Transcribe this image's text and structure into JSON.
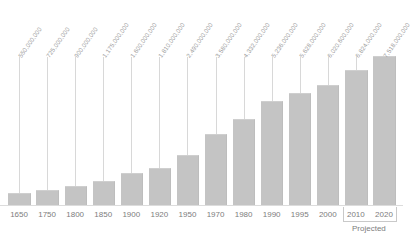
{
  "chart_data": {
    "type": "bar",
    "title": "",
    "subtitle": "",
    "xlabel": "",
    "ylabel": "",
    "grid": false,
    "legend": null,
    "ylim": [
      0,
      7518000000
    ],
    "categories": [
      "1650",
      "1750",
      "1800",
      "1850",
      "1900",
      "1920",
      "1950",
      "1970",
      "1980",
      "1990",
      "1995",
      "2000",
      "2010",
      "2020"
    ],
    "values": [
      550000000,
      725000000,
      900000000,
      1175000000,
      1600000000,
      1810000000,
      2490000000,
      3580000000,
      4332000000,
      5236000000,
      5628000000,
      6020600000,
      6824000000,
      7518000000
    ],
    "value_labels": [
      "550,000,000",
      "725,000,000",
      "900,000,000",
      "1,175,000,000",
      "1,600,000,000",
      "1,810,000,000",
      "2,490,000,000",
      "3,580,000,000",
      "4,332,000,000",
      "5,236,000,000",
      "5,628,000,000",
      "6,020,600,000",
      "6,824,000,000",
      "7,518,000,000"
    ],
    "annotations": [
      {
        "text": "Projected",
        "applies_to": [
          "2010",
          "2020"
        ]
      }
    ],
    "colors": {
      "bar": "#c4c4c4",
      "bar_edge": "#bdbdbd",
      "leader_line": "#d8d8d8",
      "axis": "#dcdcdc",
      "value_label_text": "#9b9b9b",
      "year_label_text": "#7d7d7d",
      "background": "#ffffff"
    }
  },
  "annotation": {
    "projected_text": "Projected"
  }
}
